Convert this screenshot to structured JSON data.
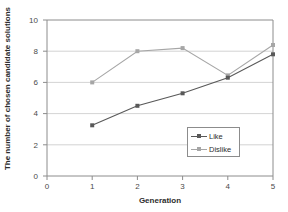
{
  "chart_data": {
    "type": "line",
    "title": "",
    "xlabel": "Generation",
    "ylabel": "The number of chosen candidate solutions",
    "x": [
      1,
      2,
      3,
      4,
      5
    ],
    "xlim": [
      0,
      5
    ],
    "ylim": [
      0,
      10
    ],
    "xticks": [
      "0",
      "1",
      "2",
      "3",
      "4",
      "5"
    ],
    "yticks": [
      "0",
      "2",
      "4",
      "6",
      "8",
      "10"
    ],
    "grid": "horizontal",
    "legend_position": "center-right",
    "series": [
      {
        "name": "Like",
        "color": "#595959",
        "marker": "square",
        "values": [
          3.25,
          4.5,
          5.3,
          6.3,
          7.8
        ]
      },
      {
        "name": "Dislike",
        "color": "#a6a6a6",
        "marker": "square",
        "values": [
          6.0,
          8.0,
          8.2,
          6.45,
          8.4
        ]
      }
    ]
  },
  "axes": {
    "y_tick_0": "0",
    "y_tick_1": "2",
    "y_tick_2": "4",
    "y_tick_3": "6",
    "y_tick_4": "8",
    "y_tick_5": "10",
    "x_tick_0": "0",
    "x_tick_1": "1",
    "x_tick_2": "2",
    "x_tick_3": "3",
    "x_tick_4": "4",
    "x_tick_5": "5"
  },
  "legend": {
    "items": [
      {
        "label": "Like"
      },
      {
        "label": "Dislike"
      }
    ]
  },
  "colors": {
    "like": "#595959",
    "dislike": "#a6a6a6",
    "grid": "#c8c8c8",
    "frame": "#8c8c8c",
    "text": "#3a3a3a"
  }
}
